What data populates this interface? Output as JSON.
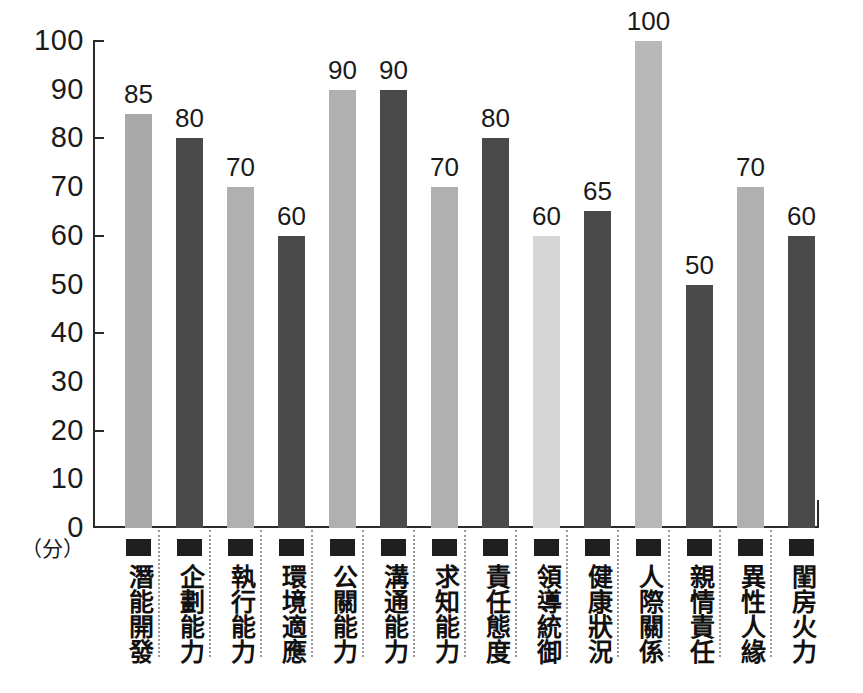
{
  "chart_data": {
    "type": "bar",
    "title": "",
    "xlabel": "",
    "ylabel": "（分）",
    "ylim": [
      0,
      100
    ],
    "ytick_step": 10,
    "ytick_labels": [
      "100",
      "90",
      "80",
      "70",
      "60",
      "50",
      "40",
      "30",
      "20",
      "10",
      "0"
    ],
    "ytick_values": [
      100,
      90,
      80,
      70,
      60,
      50,
      40,
      30,
      20,
      10,
      0
    ],
    "major_ticks": [
      100,
      80,
      60,
      40,
      20,
      0
    ],
    "grid": false,
    "legend": "none",
    "categories": [
      "潛能開發",
      "企劃能力",
      "執行能力",
      "環境適應",
      "公關能力",
      "溝通能力",
      "求知能力",
      "責任態度",
      "領導統御",
      "健康狀況",
      "人際關係",
      "親情責任",
      "異性人緣",
      "閨房火力"
    ],
    "values": [
      85,
      80,
      70,
      60,
      90,
      90,
      70,
      80,
      60,
      65,
      100,
      50,
      70,
      60
    ],
    "bar_colors": [
      "#a9a9a9",
      "#4a4a4a",
      "#b0b0b0",
      "#4a4a4a",
      "#b0b0b0",
      "#4a4a4a",
      "#b0b0b0",
      "#4a4a4a",
      "#d6d6d6",
      "#4a4a4a",
      "#b8b8b8",
      "#4a4a4a",
      "#b0b0b0",
      "#4a4a4a"
    ],
    "value_labels": [
      "85",
      "80",
      "70",
      "60",
      "90",
      "90",
      "70",
      "80",
      "60",
      "65",
      "100",
      "50",
      "70",
      "60"
    ]
  },
  "colors": {
    "axis": "#2b2b2b",
    "text": "#1a1a1a",
    "background": "#ffffff",
    "swatch": "#1f1f1f",
    "separator": "#9a9a9a"
  }
}
